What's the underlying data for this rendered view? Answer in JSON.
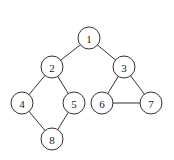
{
  "graph": {
    "node_radius": 11,
    "colors": {
      "stroke": "#333333",
      "fill": "#ffffff",
      "text": "#222222",
      "background": "#ffffff"
    },
    "nodes": [
      {
        "id": "1",
        "label": "1",
        "x": 89,
        "y": 38
      },
      {
        "id": "2",
        "label": "2",
        "x": 52,
        "y": 67
      },
      {
        "id": "3",
        "label": "3",
        "x": 124,
        "y": 67
      },
      {
        "id": "4",
        "label": "4",
        "x": 22,
        "y": 103
      },
      {
        "id": "5",
        "label": "5",
        "x": 74,
        "y": 103
      },
      {
        "id": "6",
        "label": "6",
        "x": 102,
        "y": 103
      },
      {
        "id": "7",
        "label": "7",
        "x": 151,
        "y": 103
      },
      {
        "id": "8",
        "label": "8",
        "x": 52,
        "y": 139
      }
    ],
    "edges": [
      {
        "from": "1",
        "to": "2"
      },
      {
        "from": "1",
        "to": "3"
      },
      {
        "from": "2",
        "to": "4"
      },
      {
        "from": "2",
        "to": "5"
      },
      {
        "from": "4",
        "to": "8"
      },
      {
        "from": "5",
        "to": "8"
      },
      {
        "from": "3",
        "to": "6"
      },
      {
        "from": "3",
        "to": "7"
      },
      {
        "from": "6",
        "to": "7"
      }
    ]
  }
}
